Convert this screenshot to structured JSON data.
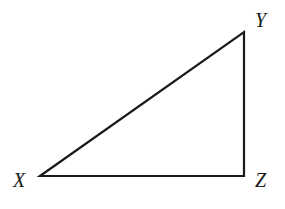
{
  "diagram": {
    "type": "right-triangle",
    "stroke_color": "#1a1a1a",
    "vertices": [
      {
        "name": "X",
        "label": "X",
        "x": 40,
        "y": 176,
        "label_x": 13,
        "label_y": 187
      },
      {
        "name": "Y",
        "label": "Y",
        "x": 244,
        "y": 32,
        "label_x": 255,
        "label_y": 27
      },
      {
        "name": "Z",
        "label": "Z",
        "x": 244,
        "y": 176,
        "label_x": 255,
        "label_y": 187
      }
    ],
    "right_angle_at": "Z"
  }
}
